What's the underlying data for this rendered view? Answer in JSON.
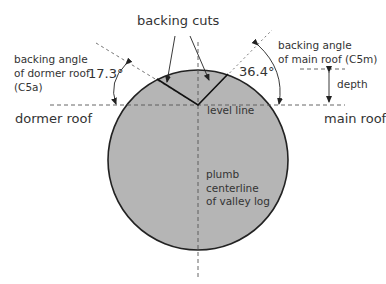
{
  "labels": {
    "backing_cuts": "backing cuts",
    "dormer_angle_title": [
      "backing angle",
      "of dormer roof",
      "(C5a)"
    ],
    "main_angle_title": [
      "backing angle",
      "of main roof (C5m)"
    ],
    "dormer_angle_value": "17.3°",
    "main_angle_value": "36.4°",
    "depth": "depth",
    "dormer_roof": "dormer roof",
    "main_roof": "main roof",
    "level_line": "level line",
    "centerline": [
      "plumb",
      "centerline",
      "of valley log"
    ]
  },
  "colors": {
    "log_fill": "#b3b3b3",
    "outline": "#222222",
    "dash": "#666666",
    "text": "#333333"
  }
}
